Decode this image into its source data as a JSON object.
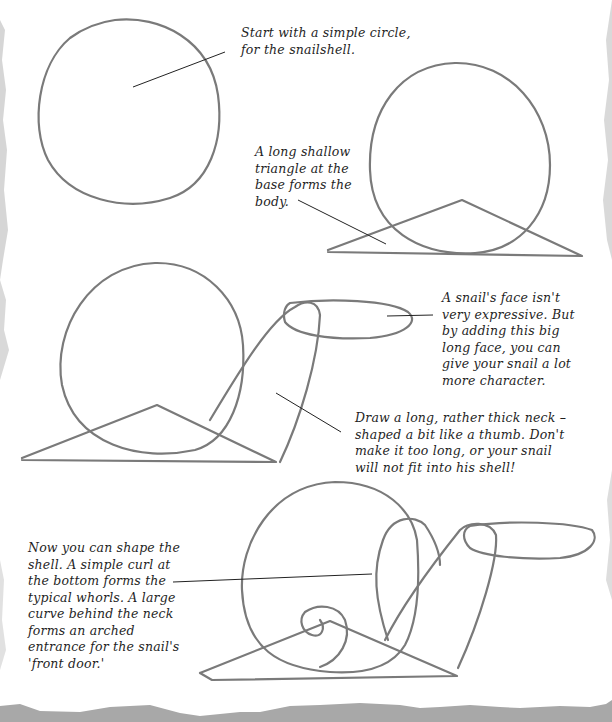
{
  "page": {
    "background": "#ffffff",
    "stroke_color": "#7a7a7a",
    "leader_color": "#222222",
    "torn_edge_color": "#a8a8a8"
  },
  "steps": [
    {
      "id": "step-1",
      "caption_lines": [
        "Start with a simple circle,",
        "for the snailshell."
      ]
    },
    {
      "id": "step-2",
      "caption_lines": [
        "A long shallow",
        "triangle at the",
        "base forms the",
        "body."
      ]
    },
    {
      "id": "step-3a",
      "caption_lines": [
        "A snail's face isn't",
        "very expressive. But",
        "by adding this big",
        "long face, you can",
        "give your snail a lot",
        "more character."
      ]
    },
    {
      "id": "step-3b",
      "caption_lines": [
        "Draw a long, rather thick neck –",
        "shaped a bit like a thumb. Don't",
        "make it too long, or your snail",
        "will not fit into his shell!"
      ]
    },
    {
      "id": "step-4",
      "caption_lines": [
        "Now you can shape the",
        "shell. A simple curl at",
        "the bottom forms the",
        "typical whorls. A large",
        "curve behind the neck",
        "forms an arched",
        "entrance for the snail's",
        "'front door.'"
      ]
    }
  ]
}
